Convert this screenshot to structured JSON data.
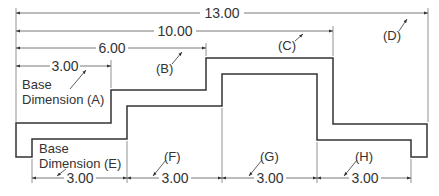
{
  "colors": {
    "background": "#ffffff",
    "object_line": "#333333",
    "dimension_line": "#555555",
    "text": "#333333"
  },
  "top_dimensions": [
    {
      "id": "13",
      "value": "13.00",
      "callout": "(D)"
    },
    {
      "id": "10",
      "value": "10.00",
      "callout": "(C)"
    },
    {
      "id": "6",
      "value": "6.00",
      "callout": "(B)"
    },
    {
      "id": "3",
      "value": "3.00",
      "callout": "Base Dimension (A)"
    }
  ],
  "bottom_dimensions": [
    {
      "id": "e",
      "value": "3.00",
      "callout": "Base Dimension (E)"
    },
    {
      "id": "f",
      "value": "3.00",
      "callout": "(F)"
    },
    {
      "id": "g",
      "value": "3.00",
      "callout": "(G)"
    },
    {
      "id": "h",
      "value": "3.00",
      "callout": "(H)"
    }
  ],
  "labels": {
    "a_line1": "Base",
    "a_line2": "Dimension (A)",
    "b": "(B)",
    "c": "(C)",
    "d": "(D)",
    "e_line1": "Base",
    "e_line2": "Dimension (E)",
    "f": "(F)",
    "g": "(G)",
    "h": "(H)",
    "dim_13": "13.00",
    "dim_10": "10.00",
    "dim_6": "6.00",
    "dim_3_top": "3.00",
    "dim_e": "3.00",
    "dim_f": "3.00",
    "dim_g": "3.00",
    "dim_h": "3.00"
  }
}
